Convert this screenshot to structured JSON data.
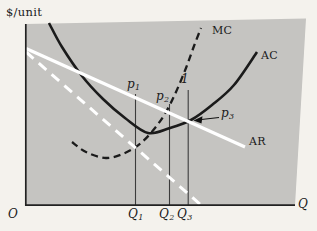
{
  "figure": {
    "y_axis_label": "$/unit",
    "x_axis_label": "Q",
    "origin_label": "O",
    "background_color": "#c5c4c1",
    "page_color": "#f4f2ed",
    "curve_color_black": "#1b1b1b",
    "curve_color_white": "#ffffff",
    "axis_color": "#222222",
    "guide_color": "#3c3c3c"
  },
  "curve_labels": {
    "mc": "MC",
    "ac": "AC",
    "ar": "AR"
  },
  "point_labels": {
    "p1": {
      "base": "p",
      "sub": "1"
    },
    "p2": {
      "base": "p",
      "sub": "2"
    },
    "p3": {
      "base": "p",
      "sub": "3"
    },
    "marker_1": "1"
  },
  "x_tick_labels": {
    "q1": {
      "base": "Q",
      "sub": "1"
    },
    "q2": {
      "base": "Q",
      "sub": "2"
    },
    "q3": {
      "base": "Q",
      "sub": "3"
    }
  },
  "chart_data": {
    "type": "line",
    "title": "",
    "xlabel": "Q",
    "ylabel": "$/unit",
    "axes_qualitative": true,
    "x_ticks": [
      "Q1",
      "Q2",
      "Q3"
    ],
    "legend": "labels drawn at curve ends (MC, AC, AR); dashed white marginal-revenue line unlabeled",
    "panel": {
      "polygon": [
        [
          25,
          24
        ],
        [
          306,
          18.5
        ],
        [
          295,
          205.5
        ],
        [
          25,
          205.5
        ]
      ]
    },
    "axes": {
      "y": [
        [
          25.8,
          24
        ],
        [
          25.8,
          205.8
        ]
      ],
      "x": [
        [
          25,
          205.2
        ],
        [
          295,
          205.2
        ]
      ],
      "color": "#222222",
      "width": 1.7
    },
    "series": [
      {
        "name": "AC",
        "style": "solid",
        "color": "#1b1b1b",
        "width": 2.6,
        "points": [
          [
            49,
            23
          ],
          [
            62,
            47
          ],
          [
            82,
            76
          ],
          [
            103,
            99
          ],
          [
            125,
            118
          ],
          [
            148,
            133
          ],
          [
            170,
            128
          ],
          [
            191,
            120
          ],
          [
            212,
            105
          ],
          [
            234,
            85
          ],
          [
            257,
            52
          ]
        ]
      },
      {
        "name": "MC",
        "style": "dashed",
        "color": "#1b1b1b",
        "width": 2.3,
        "dash": "7 4.5",
        "points": [
          [
            72,
            142
          ],
          [
            86,
            152
          ],
          [
            106,
            158
          ],
          [
            125,
            153
          ],
          [
            141,
            143
          ],
          [
            155,
            128
          ],
          [
            166,
            112
          ],
          [
            176,
            92
          ],
          [
            186,
            68
          ],
          [
            194,
            46
          ],
          [
            201,
            28
          ]
        ]
      },
      {
        "name": "AR",
        "style": "solid",
        "color": "#ffffff",
        "width": 3.2,
        "points": [
          [
            26,
            48.5
          ],
          [
            245,
            147
          ]
        ]
      },
      {
        "name": "MR",
        "style": "dashed",
        "color": "#ffffff",
        "width": 3.0,
        "dash": "10 7",
        "points": [
          [
            26,
            52
          ],
          [
            201,
            205
          ]
        ]
      }
    ],
    "guide_lines": [
      {
        "label": "Q1",
        "x": 135.5,
        "y1": 94,
        "y2": 205
      },
      {
        "label": "Q2",
        "x": 169.5,
        "y1": 104,
        "y2": 205
      },
      {
        "label": "Q3",
        "x": 188.2,
        "y1": 90,
        "y2": 205
      }
    ],
    "key_points": {
      "mc_eq_mr": {
        "x_label": "Q1",
        "px": [
          135,
          148
        ],
        "price_label": "p1"
      },
      "mc_eq_ar": {
        "x_label": "Q2",
        "px": [
          168,
          112
        ],
        "price_label": "p2"
      },
      "ac_eq_ar": {
        "x_label": "Q3",
        "px": [
          193,
          120
        ],
        "price_label": "p3"
      },
      "marker_1_at": [
        184,
        81
      ]
    },
    "arrow": {
      "from": [
        219,
        117.5
      ],
      "to": [
        197,
        120
      ],
      "head": [
        [
          193.5,
          120.5
        ],
        [
          202.5,
          116.3
        ],
        [
          201.5,
          123.6
        ]
      ]
    }
  }
}
